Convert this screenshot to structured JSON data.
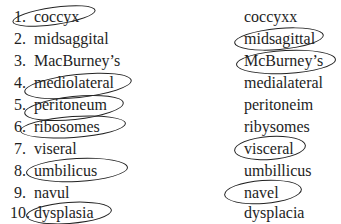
{
  "left_column": [
    {
      "num": "1.",
      "word": "coccyx",
      "circled": true
    },
    {
      "num": "2.",
      "word": "midsaggital",
      "circled": false
    },
    {
      "num": "3.",
      "word": "MacBurney’s",
      "circled": false
    },
    {
      "num": "4.",
      "word": "mediolateral",
      "circled": true
    },
    {
      "num": "5.",
      "word": "peritoneum",
      "circled": true
    },
    {
      "num": "6.",
      "word": "ribosomes",
      "circled": true
    },
    {
      "num": "7.",
      "word": "viseral",
      "circled": false
    },
    {
      "num": "8.",
      "word": "umbilicus",
      "circled": true
    },
    {
      "num": "9.",
      "word": "navul",
      "circled": false
    },
    {
      "num": "10.",
      "word": "dysplasia",
      "circled": true
    }
  ],
  "right_column": [
    {
      "word": "coccyxx",
      "circled": false
    },
    {
      "word": "midsagittal",
      "circled": true
    },
    {
      "word": "McBurney’s",
      "circled": true
    },
    {
      "word": "medialateral",
      "circled": false
    },
    {
      "word": "peritoneim",
      "circled": false
    },
    {
      "word": "ribysomes",
      "circled": false
    },
    {
      "word": "visceral",
      "circled": true
    },
    {
      "word": "umbillicus",
      "circled": false
    },
    {
      "word": "navel",
      "circled": true
    },
    {
      "word": "dysplacia",
      "circled": false
    }
  ]
}
